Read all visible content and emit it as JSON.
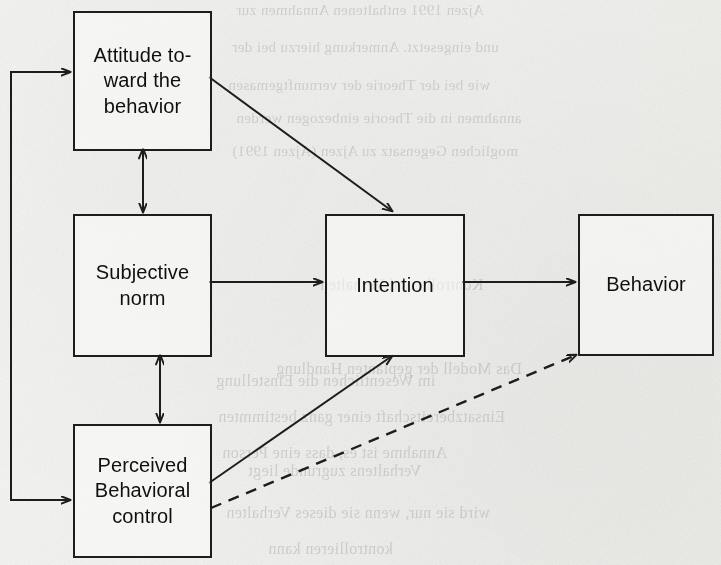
{
  "figure": {
    "type": "flow-diagram",
    "background_color": "#f1f1ef",
    "ink_color": "#1d1d1d"
  },
  "nodes": [
    {
      "id": "attitude",
      "label": "Attitude to-\nward the\nbehavior",
      "line1": "Attitude to-",
      "line2": "ward the",
      "line3": "behavior",
      "x": 73,
      "y": 11,
      "w": 135,
      "h": 136
    },
    {
      "id": "norm",
      "label": "Subjective\nnorm",
      "line1": "Subjective",
      "line2": "norm",
      "line3": "",
      "x": 73,
      "y": 214,
      "w": 135,
      "h": 139
    },
    {
      "id": "pbc",
      "label": "Perceived\nBehavioral\ncontrol",
      "line1": "Perceived",
      "line2": "Behavioral",
      "line3": "control",
      "x": 73,
      "y": 424,
      "w": 135,
      "h": 130
    },
    {
      "id": "intention",
      "label": "Intention",
      "line1": "Intention",
      "line2": "",
      "line3": "",
      "x": 325,
      "y": 214,
      "w": 136,
      "h": 139
    },
    {
      "id": "behavior",
      "label": "Behavior",
      "line1": "Behavior",
      "line2": "",
      "line3": "",
      "x": 578,
      "y": 214,
      "w": 132,
      "h": 138
    }
  ],
  "edges": [
    {
      "id": "attitude-norm",
      "from": "attitude",
      "to": "norm",
      "style": "solid",
      "arrow": "double",
      "orientation": "vertical"
    },
    {
      "id": "norm-pbc",
      "from": "norm",
      "to": "pbc",
      "style": "solid",
      "arrow": "double",
      "orientation": "vertical"
    },
    {
      "id": "attitude-intention",
      "from": "attitude",
      "to": "intention",
      "style": "solid",
      "arrow": "single",
      "orientation": "diagonal"
    },
    {
      "id": "norm-intention",
      "from": "norm",
      "to": "intention",
      "style": "solid",
      "arrow": "single",
      "orientation": "horizontal"
    },
    {
      "id": "pbc-intention",
      "from": "pbc",
      "to": "intention",
      "style": "solid",
      "arrow": "single",
      "orientation": "diagonal"
    },
    {
      "id": "intention-behavior",
      "from": "intention",
      "to": "behavior",
      "style": "solid",
      "arrow": "single",
      "orientation": "horizontal"
    },
    {
      "id": "pbc-behavior",
      "from": "pbc",
      "to": "behavior",
      "style": "dashed",
      "arrow": "single",
      "orientation": "diagonal"
    },
    {
      "id": "pbc-attitude-loop",
      "from": "pbc",
      "to": "attitude",
      "style": "solid",
      "arrow": "double",
      "orientation": "bracket-left"
    }
  ],
  "bleed_text": [
    {
      "text": "Ajzen 1991 enthaltenen Annahmen zur",
      "x": 236,
      "y": 2,
      "size": 15
    },
    {
      "text": "und eingesetzt. Anmerkung hierzu bei der",
      "x": 232,
      "y": 39,
      "size": 15
    },
    {
      "text": "wie bei der Theorie der vernunftgemasen",
      "x": 228,
      "y": 77,
      "size": 15
    },
    {
      "text": "annahmen in die Theorie einbezogen werden",
      "x": 236,
      "y": 110,
      "size": 15
    },
    {
      "text": "moglichen Gegensatz zu Ajzen (Ajzen 1991)",
      "x": 232,
      "y": 143,
      "size": 15
    },
    {
      "text": "Kontrolle und Verhalten",
      "x": 320,
      "y": 276,
      "size": 16
    },
    {
      "text": "Das Modell der geplanten Handlung",
      "x": 276,
      "y": 360,
      "size": 16
    },
    {
      "text": "im Wesentlichen die Einstellung",
      "x": 216,
      "y": 372,
      "size": 16
    },
    {
      "text": "Einsatzbereitschaft einer ganz bestimmten",
      "x": 218,
      "y": 408,
      "size": 16
    },
    {
      "text": "Annahme ist es, dass eine Person",
      "x": 222,
      "y": 444,
      "size": 16
    },
    {
      "text": "Verhaltens zugrunde liegt",
      "x": 248,
      "y": 462,
      "size": 16
    },
    {
      "text": "wird sie nur, wenn sie dieses Verhalten",
      "x": 226,
      "y": 504,
      "size": 16
    },
    {
      "text": "kontrollieren kann",
      "x": 268,
      "y": 540,
      "size": 16
    }
  ]
}
